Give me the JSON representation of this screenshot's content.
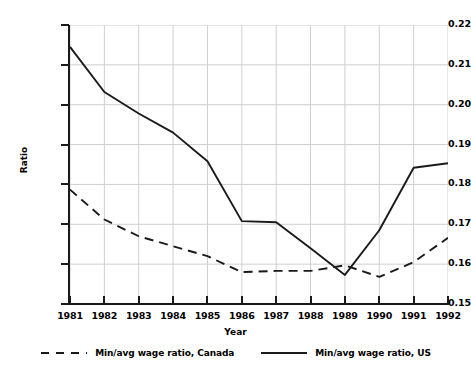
{
  "chart_data": {
    "type": "line",
    "title": "",
    "xlabel": "Year",
    "ylabel": "Ratio",
    "categories": [
      1981,
      1982,
      1983,
      1984,
      1985,
      1986,
      1987,
      1988,
      1989,
      1990,
      1991,
      1992
    ],
    "xtick_labels": [
      "1981",
      "1982",
      "1983",
      "1984",
      "1985",
      "1986",
      "1987",
      "1988",
      "1989",
      "1990",
      "1991",
      "1992"
    ],
    "ytick_labels": [
      "0.15",
      "0.16",
      "0.17",
      "0.18",
      "0.19",
      "0.20",
      "0.21",
      "0.22"
    ],
    "yticks": [
      0.15,
      0.16,
      0.17,
      0.18,
      0.19,
      0.2,
      0.21,
      0.22
    ],
    "ylim": [
      0.15,
      0.22
    ],
    "xlim": [
      1981,
      1992
    ],
    "grid": true,
    "legend_position": "bottom",
    "series": [
      {
        "name": "Min/avg wage ratio, Canada",
        "style": "dashed",
        "color": "#1a1a1a",
        "values": [
          0.1787,
          0.1712,
          0.167,
          0.1645,
          0.162,
          0.158,
          0.1583,
          0.1583,
          0.1597,
          0.1568,
          0.1605,
          0.1666
        ]
      },
      {
        "name": "Min/avg wage ratio, US",
        "style": "solid",
        "color": "#1a1a1a",
        "values": [
          0.2145,
          0.2032,
          0.1978,
          0.193,
          0.1858,
          0.1708,
          0.1705,
          0.164,
          0.1573,
          0.1685,
          0.1842,
          0.1853
        ]
      }
    ]
  },
  "legend": {
    "entries": [
      {
        "label": "Min/avg wage ratio, Canada",
        "style": "dashed"
      },
      {
        "label": "Min/avg wage ratio, US",
        "style": "solid"
      }
    ]
  },
  "axis": {
    "y_title": "Ratio",
    "x_title": "Year"
  },
  "colors": {
    "line": "#1a1a1a",
    "grid": "#cfcfcf",
    "axis": "#1a1a1a",
    "background": "#ffffff"
  }
}
